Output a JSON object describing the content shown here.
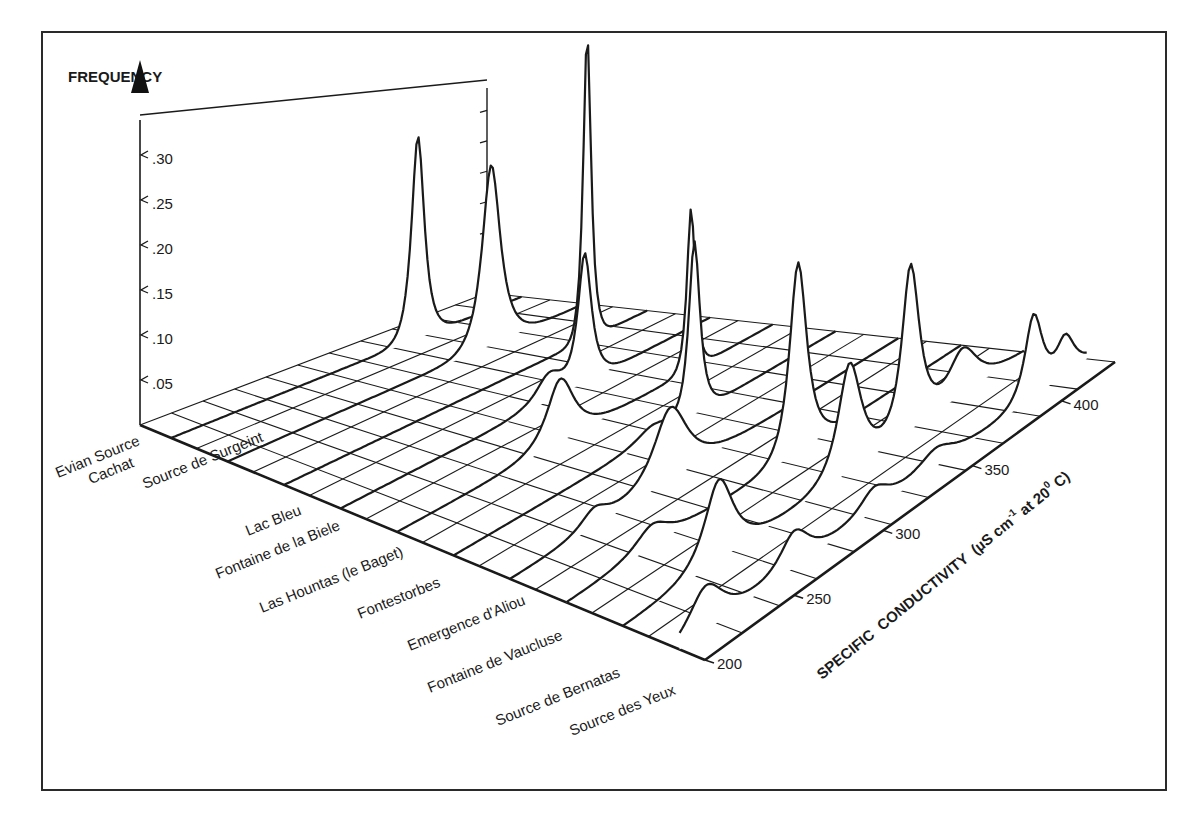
{
  "chart_data": {
    "type": "area",
    "subtype": "3d-waterfall-frequency-distributions",
    "title": "",
    "zlabel": "FREQUENCY",
    "xlabel": "SPECIFIC CONDUCTIVITY (µS cm-1 at 20 0 C)",
    "xlabel_parts": {
      "main": "SPECIFIC  CONDUCTIVITY  (µS cm",
      "sup1": "-1",
      "mid": " at 20",
      "sup2": "0",
      "end": " C)"
    },
    "x_ticks": [
      "200",
      "250",
      "300",
      "350",
      "400"
    ],
    "x_range": [
      200,
      430
    ],
    "z_ticks": [
      ".05",
      ".10",
      ".15",
      ".20",
      ".25",
      ".30"
    ],
    "z_range": [
      0,
      0.35
    ],
    "grid": true,
    "series": [
      {
        "name": "Evian Source Cachat",
        "label_lines": [
          "Evian Source",
          "Cachat"
        ],
        "peaks": [
          {
            "x": 362,
            "height": 0.225,
            "width": 5
          }
        ]
      },
      {
        "name": "Source de Surgeint",
        "label_lines": [
          "Source de Surgeint"
        ],
        "peaks": [
          {
            "x": 370,
            "height": 0.2,
            "width": 7
          }
        ]
      },
      {
        "name": "Lac Bleu",
        "label_lines": [
          "Lac Bleu"
        ],
        "peaks": [
          {
            "x": 392,
            "height": 0.34,
            "width": 3
          }
        ]
      },
      {
        "name": "Fontaine de la Biele",
        "label_lines": [
          "Fontaine de la Biele"
        ],
        "peaks": [
          {
            "x": 352,
            "height": 0.14,
            "width": 5
          },
          {
            "x": 330,
            "height": 0.03,
            "width": 10
          }
        ]
      },
      {
        "name": "Las Hountas (le Baget)",
        "label_lines": [
          "Las Hountas  (le Baget)"
        ],
        "peaks": [
          {
            "x": 300,
            "height": 0.07,
            "width": 10
          },
          {
            "x": 380,
            "height": 0.18,
            "width": 3
          }
        ]
      },
      {
        "name": "Fontestorbes",
        "label_lines": [
          "Fontestorbes"
        ],
        "peaks": [
          {
            "x": 345,
            "height": 0.19,
            "width": 4
          },
          {
            "x": 320,
            "height": 0.015,
            "width": 12
          }
        ]
      },
      {
        "name": "Emergence d'Aliou",
        "label_lines": [
          "Emergence d'Aliou"
        ],
        "peaks": [
          {
            "x": 295,
            "height": 0.08,
            "width": 12
          },
          {
            "x": 250,
            "height": 0.02,
            "width": 10
          }
        ]
      },
      {
        "name": "Fontaine de Vaucluse",
        "label_lines": [
          "Fontaine de Vaucluse"
        ],
        "peaks": [
          {
            "x": 335,
            "height": 0.21,
            "width": 6
          },
          {
            "x": 250,
            "height": 0.025,
            "width": 12
          }
        ]
      },
      {
        "name": "Source de Bernatas",
        "label_lines": [
          "Source de Bernatas"
        ],
        "peaks": [
          {
            "x": 255,
            "height": 0.09,
            "width": 10
          },
          {
            "x": 330,
            "height": 0.12,
            "width": 8
          },
          {
            "x": 365,
            "height": 0.18,
            "width": 6
          },
          {
            "x": 395,
            "height": 0.05,
            "width": 10
          }
        ]
      },
      {
        "name": "Source des Yeux",
        "label_lines": [
          "Source des Yeux"
        ],
        "peaks": [
          {
            "x": 215,
            "height": 0.05,
            "width": 12
          },
          {
            "x": 265,
            "height": 0.04,
            "width": 10
          },
          {
            "x": 310,
            "height": 0.025,
            "width": 10
          },
          {
            "x": 345,
            "height": 0.02,
            "width": 12
          },
          {
            "x": 400,
            "height": 0.09,
            "width": 6
          },
          {
            "x": 418,
            "height": 0.04,
            "width": 6
          }
        ]
      }
    ],
    "layout": {
      "floor_corners": {
        "origin": [
          140,
          425
        ],
        "back": [
          487,
          293
        ],
        "right": [
          1115,
          362
        ],
        "front": [
          705,
          660
        ]
      },
      "z_pixels_per_unit": 900,
      "grid_lines_conductivity": 11,
      "grid_lines_springs": 10
    },
    "colors": {
      "line": "#1a1a1a",
      "fill": "#ffffff",
      "frame": "#2a2a2a"
    }
  }
}
